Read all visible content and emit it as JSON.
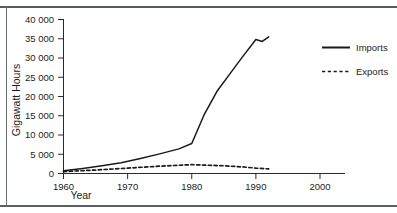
{
  "figure": {
    "background_color": "#ffffff",
    "ink_color": "#1a1a1a",
    "rule_color": "#565c5f",
    "ghost_text_top": "........."
  },
  "chart_data": {
    "type": "line",
    "title": "",
    "xlabel": "Year",
    "ylabel": "Gigawatt Hours",
    "xlim": [
      1960,
      2000
    ],
    "ylim": [
      0,
      40000
    ],
    "xticks": [
      1960,
      1970,
      1980,
      1990,
      2000
    ],
    "xtick_labels": [
      "1960",
      "1970",
      "1980",
      "1990",
      "2000"
    ],
    "yticks": [
      0,
      5000,
      10000,
      15000,
      20000,
      25000,
      30000,
      35000,
      40000
    ],
    "ytick_labels": [
      "0",
      "5 000",
      "10 000",
      "15 000",
      "20 000",
      "25 000",
      "30 000",
      "35 000",
      "40 000"
    ],
    "grid": false,
    "legend_position": "right",
    "series": [
      {
        "name": "Imports",
        "style": "solid",
        "color": "#1a1a1a",
        "x": [
          1960,
          1963,
          1966,
          1969,
          1972,
          1975,
          1978,
          1980,
          1982,
          1984,
          1986,
          1988,
          1990,
          1991,
          1992
        ],
        "values": [
          700,
          1300,
          2000,
          2800,
          3900,
          5100,
          6400,
          7800,
          15500,
          21500,
          26000,
          30500,
          34800,
          34300,
          35500
        ]
      },
      {
        "name": "Exports",
        "style": "dashed",
        "color": "#1a1a1a",
        "x": [
          1960,
          1965,
          1970,
          1975,
          1980,
          1985,
          1988,
          1990,
          1992
        ],
        "values": [
          500,
          900,
          1400,
          1900,
          2300,
          2000,
          1700,
          1400,
          1200
        ]
      }
    ]
  },
  "legend": {
    "entries": [
      {
        "label": "Imports",
        "style": "solid"
      },
      {
        "label": "Exports",
        "style": "dashed"
      }
    ]
  }
}
